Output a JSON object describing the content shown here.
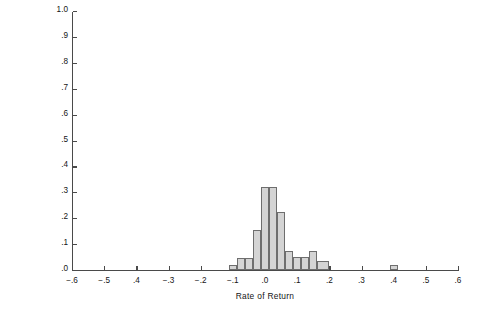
{
  "chart_data": {
    "type": "bar",
    "title": "",
    "xlabel": "Rate of Return",
    "ylabel": "Percentage Frequency",
    "xlim": [
      -0.6,
      0.6
    ],
    "ylim": [
      0.0,
      1.0
    ],
    "grid": false,
    "legend": null,
    "bin_width": 0.025,
    "xticks": [
      -0.6,
      -0.5,
      -0.4,
      -0.3,
      -0.2,
      -0.1,
      0.0,
      0.1,
      0.2,
      0.3,
      0.4,
      0.5,
      0.6
    ],
    "xticklabels": [
      "−.6",
      "−.5",
      ".4",
      "−.3",
      "−.2",
      "−.1",
      ".0",
      ".1",
      ".2",
      ".3",
      ".4",
      ".5",
      ".6"
    ],
    "yticks": [
      0.0,
      0.1,
      0.2,
      0.3,
      0.4,
      0.5,
      0.6,
      0.7,
      0.8,
      0.9,
      1.0
    ],
    "yticklabels": [
      ".0",
      ".1",
      ".2",
      ".3",
      ".4",
      ".5",
      ".6",
      ".7",
      ".8",
      ".9",
      "1.0"
    ],
    "bars": [
      {
        "x0": -0.1125,
        "x1": -0.0875,
        "value": 0.02
      },
      {
        "x0": -0.0875,
        "x1": -0.0625,
        "value": 0.045
      },
      {
        "x0": -0.0625,
        "x1": -0.0375,
        "value": 0.045
      },
      {
        "x0": -0.0375,
        "x1": -0.0125,
        "value": 0.155
      },
      {
        "x0": -0.0125,
        "x1": 0.0125,
        "value": 0.32
      },
      {
        "x0": 0.0125,
        "x1": 0.0375,
        "value": 0.32
      },
      {
        "x0": 0.0375,
        "x1": 0.0625,
        "value": 0.225
      },
      {
        "x0": 0.0625,
        "x1": 0.0875,
        "value": 0.075
      },
      {
        "x0": 0.0875,
        "x1": 0.1125,
        "value": 0.05
      },
      {
        "x0": 0.1125,
        "x1": 0.1375,
        "value": 0.05
      },
      {
        "x0": 0.1375,
        "x1": 0.1625,
        "value": 0.075
      },
      {
        "x0": 0.1625,
        "x1": 0.2,
        "value": 0.035
      },
      {
        "x0": 0.3875,
        "x1": 0.4125,
        "value": 0.02
      }
    ]
  }
}
